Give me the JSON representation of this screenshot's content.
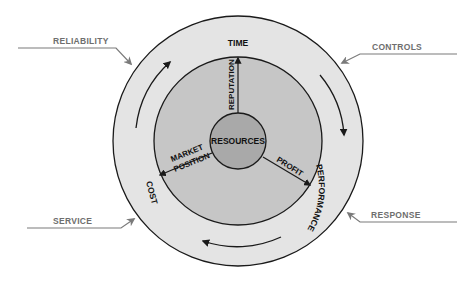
{
  "diagram": {
    "center_label": "RESOURCES",
    "inner_spokes": [
      {
        "label": "REPUTATION"
      },
      {
        "label_line1": "MARKET",
        "label_line2": "POSITION"
      },
      {
        "label": "PROFIT"
      }
    ],
    "ring_labels": {
      "top": "TIME",
      "right": "PERFORMANCE",
      "left": "COST"
    },
    "external_inputs": {
      "top_left": "RELIABILITY",
      "top_right": "CONTROLS",
      "bottom_left": "SERVICE",
      "bottom_right": "RESPONSE"
    },
    "colors": {
      "outer_ring": "#e4e4e4",
      "inner_disc": "#c6c6c6",
      "center_disc": "#a9a9a9",
      "stroke": "#1a1a1a",
      "input_arrows": "#7a7a7a"
    }
  }
}
